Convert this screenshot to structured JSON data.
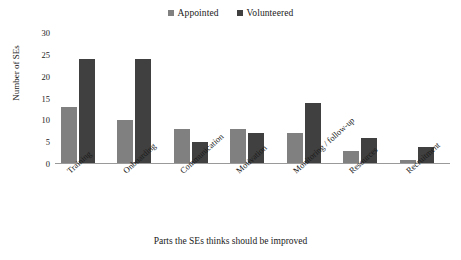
{
  "chart_data": {
    "type": "bar",
    "title": "",
    "subtitle": "",
    "xlabel": "Parts the SEs thinks should be improved",
    "ylabel": "Number of SEs",
    "categories": [
      "Training",
      "Onboarding",
      "Communication",
      "Motivation",
      "Monitoring / follow-up",
      "Resources",
      "Recruitment"
    ],
    "series": [
      {
        "name": "Appointed",
        "color": "#808080",
        "values": [
          13,
          10,
          8,
          8,
          7,
          3,
          1
        ]
      },
      {
        "name": "Volunteered",
        "color": "#404040",
        "values": [
          24,
          24,
          5,
          7,
          14,
          6,
          4
        ]
      }
    ],
    "ylim": [
      0,
      30
    ],
    "ytick_values": [
      0,
      5,
      10,
      15,
      20,
      25,
      30
    ],
    "ytick_labels": [
      "0",
      "5",
      "10",
      "15",
      "20",
      "25",
      "30"
    ],
    "grid": false,
    "legend_position": "top-center",
    "xtick_rotation": -42,
    "background_color": "#ffffff",
    "axis_color": "#9a9a9a"
  },
  "legend": {
    "entries": [
      {
        "label": "Appointed",
        "swatch_color": "#808080"
      },
      {
        "label": "Volunteered",
        "swatch_color": "#404040"
      }
    ]
  }
}
